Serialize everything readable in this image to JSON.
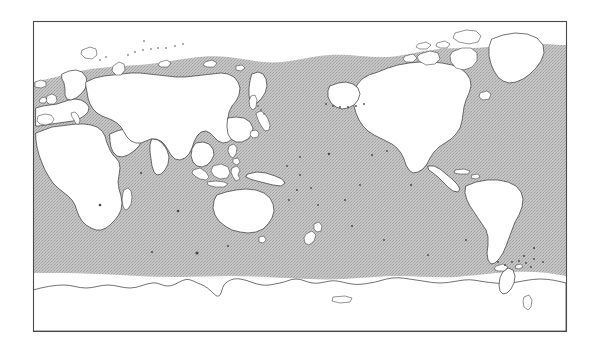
{
  "figure": {
    "type": "distribution-range-map",
    "title": "",
    "caption": "",
    "projection": "Pacific-centred cylindrical (Plate Carrée)",
    "background_color": "#ffffff"
  },
  "frame": {
    "name": "map-border",
    "x": 33,
    "y": 21,
    "width": 533,
    "height": 310,
    "stroke_color": "#4a4a4a",
    "stroke_width": 1.1
  },
  "legend": {
    "visible": false,
    "entries": [
      {
        "label": "Distribution range",
        "swatch_color": "#b9b9b9",
        "pattern": "dithered-halftone-gray"
      },
      {
        "label": "Land",
        "swatch_color": "#ffffff",
        "outline_color": "#3a3a3a"
      }
    ]
  },
  "layers": {
    "ocean_shading": {
      "name": "range-shading",
      "fill_color": "#bcbcbc",
      "pattern": "halftone-dither",
      "description": "Shaded oceanic distribution band spanning from the sub-Arctic limit south to the Antarctic Convergence"
    },
    "land": {
      "name": "landmasses",
      "fill_color": "#ffffff",
      "outline_color": "#3a3a3a",
      "outline_width": 0.72
    },
    "antarctica": {
      "name": "antarctica-coastline",
      "fill_color": "#ffffff",
      "outline_color": "#3a3a3a"
    }
  },
  "axes": {
    "visible": false,
    "x_ticks": [],
    "y_ticks": [],
    "x_label": "",
    "y_label": ""
  },
  "annotations": [],
  "map_geometry": {
    "lon_center": 180,
    "lon_min": -60,
    "lon_max": 300,
    "lat_min": -90,
    "lat_max": 90,
    "northern_shading_limit_note": "irregular wavy boundary near 60-70 degrees north",
    "southern_shading_limit_note": "Antarctic Convergence, white gap before Antarctic coastline"
  },
  "landmass_labels": [
    "Africa",
    "Europe",
    "Asia",
    "Australia",
    "North America",
    "South America",
    "Antarctica",
    "Greenland",
    "New Zealand",
    "Japan",
    "Madagascar",
    "Indonesia",
    "New Guinea",
    "Philippines",
    "Iceland",
    "British Isles"
  ]
}
